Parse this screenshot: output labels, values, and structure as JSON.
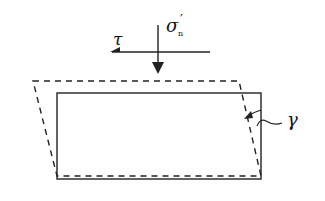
{
  "diagram": {
    "type": "simple shear deformation",
    "labels": {
      "shear_stress": "τ",
      "normal_stress_symbol": "σ",
      "normal_stress_prime": "′",
      "normal_stress_subscript": "n",
      "shear_strain": "γ"
    },
    "elements": {
      "original_shape": "solid rectangle",
      "deformed_shape": "dashed parallelogram",
      "normal_load_arrow": "downward arrow",
      "shear_arrow": "leftward arrow"
    },
    "colors": {
      "line": "#222222",
      "background": "#ffffff"
    }
  }
}
